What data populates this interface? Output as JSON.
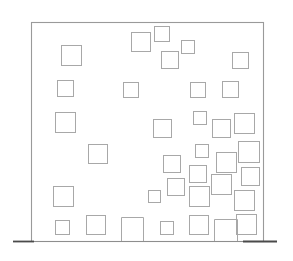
{
  "document": {
    "type": "architectural-elevation",
    "title": "Building Facade Elevation",
    "description": "Line drawing of a rectangular building facade with scattered square window openings and a ground line."
  },
  "canvas": {
    "width": 293,
    "height": 261,
    "background_color": "#ffffff"
  },
  "styles": {
    "facade_outline_color": "#9a9a9a",
    "facade_outline_width": 1.1,
    "facade_fill_color": "#ffffff",
    "window_stroke_color": "#a8a8a8",
    "window_stroke_width": 1.0,
    "window_fill_color": "#ffffff",
    "ground_line_color": "#8e8e8e",
    "ground_line_width": 1.2,
    "ground_line_accent_color": "#4a4a4a",
    "ground_line_accent_width": 1.8
  },
  "facade": {
    "name": "building-facade",
    "x": 31,
    "y": 22,
    "width": 232,
    "height": 219
  },
  "ground_line": {
    "name": "ground-line",
    "x1": 13,
    "x2": 277,
    "y": 241,
    "accent_x1": 13,
    "accent_x2": 34,
    "accent_x3": 243,
    "accent_x4": 277
  },
  "windows": [
    {
      "id": "w01",
      "row": 1,
      "x": 131,
      "y": 32,
      "w": 19,
      "h": 19
    },
    {
      "id": "w02",
      "row": 1,
      "x": 154,
      "y": 26,
      "w": 15,
      "h": 15
    },
    {
      "id": "w03",
      "row": 1,
      "x": 181,
      "y": 40,
      "w": 13,
      "h": 13
    },
    {
      "id": "w04",
      "row": 1,
      "x": 61,
      "y": 45,
      "w": 20,
      "h": 20
    },
    {
      "id": "w05",
      "row": 1,
      "x": 161,
      "y": 51,
      "w": 17,
      "h": 17
    },
    {
      "id": "w06",
      "row": 1,
      "x": 232,
      "y": 52,
      "w": 16,
      "h": 16
    },
    {
      "id": "w07",
      "row": 2,
      "x": 57,
      "y": 80,
      "w": 16,
      "h": 16
    },
    {
      "id": "w08",
      "row": 2,
      "x": 123,
      "y": 82,
      "w": 15,
      "h": 15
    },
    {
      "id": "w09",
      "row": 2,
      "x": 190,
      "y": 82,
      "w": 15,
      "h": 15
    },
    {
      "id": "w10",
      "row": 2,
      "x": 222,
      "y": 81,
      "w": 16,
      "h": 16
    },
    {
      "id": "w11",
      "row": 3,
      "x": 55,
      "y": 112,
      "w": 20,
      "h": 20
    },
    {
      "id": "w12",
      "row": 3,
      "x": 193,
      "y": 111,
      "w": 13,
      "h": 13
    },
    {
      "id": "w13",
      "row": 3,
      "x": 153,
      "y": 119,
      "w": 18,
      "h": 18
    },
    {
      "id": "w14",
      "row": 3,
      "x": 212,
      "y": 119,
      "w": 18,
      "h": 18
    },
    {
      "id": "w15",
      "row": 3,
      "x": 234,
      "y": 113,
      "w": 20,
      "h": 20
    },
    {
      "id": "w16",
      "row": 4,
      "x": 88,
      "y": 144,
      "w": 19,
      "h": 19
    },
    {
      "id": "w17",
      "row": 4,
      "x": 195,
      "y": 144,
      "w": 13,
      "h": 13
    },
    {
      "id": "w18",
      "row": 4,
      "x": 238,
      "y": 141,
      "w": 21,
      "h": 21
    },
    {
      "id": "w19",
      "row": 4,
      "x": 163,
      "y": 155,
      "w": 17,
      "h": 17
    },
    {
      "id": "w20",
      "row": 4,
      "x": 216,
      "y": 152,
      "w": 20,
      "h": 20
    },
    {
      "id": "w21",
      "row": 4,
      "x": 189,
      "y": 165,
      "w": 17,
      "h": 17
    },
    {
      "id": "w22",
      "row": 5,
      "x": 241,
      "y": 167,
      "w": 18,
      "h": 18
    },
    {
      "id": "w23",
      "row": 5,
      "x": 167,
      "y": 178,
      "w": 17,
      "h": 17
    },
    {
      "id": "w24",
      "row": 5,
      "x": 211,
      "y": 174,
      "w": 20,
      "h": 20
    },
    {
      "id": "w25",
      "row": 5,
      "x": 148,
      "y": 190,
      "w": 12,
      "h": 12
    },
    {
      "id": "w26",
      "row": 5,
      "x": 53,
      "y": 186,
      "w": 20,
      "h": 20
    },
    {
      "id": "w27",
      "row": 5,
      "x": 189,
      "y": 186,
      "w": 20,
      "h": 20
    },
    {
      "id": "w28",
      "row": 5,
      "x": 234,
      "y": 190,
      "w": 20,
      "h": 20
    },
    {
      "id": "w29",
      "row": 6,
      "x": 55,
      "y": 220,
      "w": 14,
      "h": 14
    },
    {
      "id": "w30",
      "row": 6,
      "x": 86,
      "y": 215,
      "w": 19,
      "h": 19
    },
    {
      "id": "w31",
      "row": 6,
      "x": 160,
      "y": 221,
      "w": 13,
      "h": 13
    },
    {
      "id": "w32",
      "row": 6,
      "x": 189,
      "y": 215,
      "w": 19,
      "h": 19
    },
    {
      "id": "w33",
      "row": 6,
      "x": 236,
      "y": 214,
      "w": 20,
      "h": 20
    }
  ],
  "doors": [
    {
      "id": "d01",
      "name": "ground-opening-left",
      "x": 121,
      "y": 217,
      "w": 22,
      "h": 24
    },
    {
      "id": "d02",
      "name": "ground-opening-right",
      "x": 214,
      "y": 219,
      "w": 23,
      "h": 22
    }
  ]
}
